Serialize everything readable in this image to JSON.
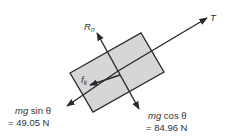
{
  "diagram": {
    "type": "free-body diagram",
    "block_fill": "#d6d6d6",
    "line_color": "#2a2a2a",
    "forces": {
      "tension": {
        "symbol": "T"
      },
      "normal": {
        "symbol": "R",
        "subscript": "n"
      },
      "friction": {
        "symbol": "f",
        "subscript": "k"
      },
      "parallel_weight": {
        "expr_italic": "mg",
        "expr_rest": " sin θ",
        "value": "= 49.05 N"
      },
      "perpendicular_weight": {
        "expr_italic": "mg",
        "expr_rest": " cos θ",
        "value": "= 84.96 N"
      }
    }
  }
}
